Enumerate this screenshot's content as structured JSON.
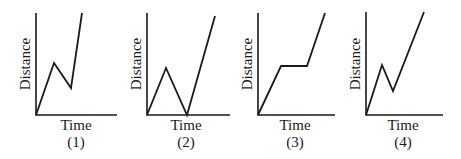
{
  "figure": {
    "graphs": [
      {
        "id": "1",
        "y_label": "Distance",
        "x_label": "Time",
        "caption": "(1)",
        "axis": {
          "origin": [
            36,
            115
          ],
          "y_top": 13,
          "x_right": 117
        },
        "path_points": [
          [
            36,
            115
          ],
          [
            54,
            63
          ],
          [
            71,
            88
          ],
          [
            82,
            13
          ]
        ],
        "description": "rises, falls partway back, then rises steeply"
      },
      {
        "id": "2",
        "y_label": "Distance",
        "x_label": "Time",
        "caption": "(2)",
        "axis": {
          "origin": [
            147,
            115
          ],
          "y_top": 13,
          "x_right": 230
        },
        "path_points": [
          [
            147,
            115
          ],
          [
            166,
            68
          ],
          [
            187,
            115
          ],
          [
            215,
            16
          ]
        ],
        "description": "rises, returns to zero distance, then rises steeply"
      },
      {
        "id": "3",
        "y_label": "Distance",
        "x_label": "Time",
        "caption": "(3)",
        "axis": {
          "origin": [
            258,
            115
          ],
          "y_top": 13,
          "x_right": 335
        },
        "path_points": [
          [
            258,
            115
          ],
          [
            281,
            66
          ],
          [
            307,
            66
          ],
          [
            325,
            13
          ]
        ],
        "description": "rises, stays constant, then rises again"
      },
      {
        "id": "4",
        "y_label": "Distance",
        "x_label": "Time",
        "caption": "(4)",
        "axis": {
          "origin": [
            366,
            115
          ],
          "y_top": 12,
          "x_right": 443
        },
        "path_points": [
          [
            366,
            115
          ],
          [
            382,
            65
          ],
          [
            393,
            91
          ],
          [
            424,
            12
          ]
        ],
        "description": "rises, falls partway back, then rises steadily"
      }
    ]
  }
}
